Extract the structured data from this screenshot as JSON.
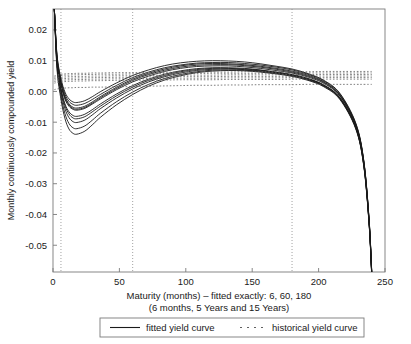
{
  "chart_data": {
    "type": "line",
    "title": "",
    "xlabel": "Maturity (months) – fitted exactly: 6, 60, 180",
    "xlabel_line2": "(6 months, 5 Years and 15 Years)",
    "ylabel": "Monthly continuously compounded yield",
    "xlim": [
      0,
      250
    ],
    "ylim": [
      -0.0587,
      0.0268
    ],
    "xticks": [
      0,
      50,
      100,
      150,
      200,
      250
    ],
    "xticklabels": [
      "0",
      "50",
      "100",
      "150",
      "200",
      "250"
    ],
    "yticks": [
      0.02,
      0.01,
      0.0,
      -0.01,
      -0.02,
      -0.03,
      -0.04,
      -0.05
    ],
    "yticklabels": [
      "0.02",
      "0.01",
      "0.00",
      "-0.01",
      "-0.02",
      "-0.03",
      "-0.04",
      "-0.05"
    ],
    "grid": false,
    "vertical_reference_lines": [
      6,
      60,
      180
    ],
    "vertical_reference_style": "dotted",
    "legend_position": "below-axes",
    "legend": [
      {
        "label": "fitted yield curve",
        "style": "solid",
        "color": "#1a1a1a"
      },
      {
        "label": "historical yield curve",
        "style": "dotted",
        "color": "#555555"
      }
    ],
    "x": [
      1,
      3,
      6,
      9,
      12,
      15,
      18,
      24,
      30,
      36,
      48,
      60,
      72,
      84,
      96,
      108,
      120,
      132,
      144,
      156,
      168,
      180,
      192,
      204,
      216,
      228,
      234,
      238,
      240
    ],
    "series": [
      {
        "name": "fitted yield curve 1",
        "style": "solid",
        "values": [
          0.0268,
          0.0105,
          0.0021,
          -0.0025,
          -0.0048,
          -0.0058,
          -0.0061,
          -0.0055,
          -0.004,
          -0.0024,
          0.0006,
          0.0031,
          0.005,
          0.0065,
          0.0075,
          0.0081,
          0.0083,
          0.0083,
          0.008,
          0.0075,
          0.0068,
          0.006,
          0.0047,
          0.0026,
          -0.0015,
          -0.011,
          -0.023,
          -0.042,
          -0.059
        ]
      },
      {
        "name": "fitted yield curve 2",
        "style": "solid",
        "values": [
          0.0268,
          0.0112,
          0.003,
          -0.0016,
          -0.004,
          -0.0051,
          -0.0054,
          -0.0048,
          -0.0033,
          -0.0016,
          0.0014,
          0.004,
          0.0059,
          0.0073,
          0.0083,
          0.0089,
          0.0091,
          0.009,
          0.0087,
          0.0082,
          0.0075,
          0.0066,
          0.0053,
          0.0031,
          -0.0011,
          -0.0108,
          -0.0228,
          -0.0418,
          -0.0588
        ]
      },
      {
        "name": "fitted yield curve 3",
        "style": "solid",
        "values": [
          0.0268,
          0.0098,
          0.001,
          -0.004,
          -0.0066,
          -0.0078,
          -0.0081,
          -0.0074,
          -0.0058,
          -0.004,
          -0.0008,
          0.0019,
          0.004,
          0.0056,
          0.0067,
          0.0074,
          0.0077,
          0.0077,
          0.0075,
          0.007,
          0.0063,
          0.0055,
          0.0042,
          0.0021,
          -0.002,
          -0.0115,
          -0.0235,
          -0.0424,
          -0.0592
        ]
      },
      {
        "name": "fitted yield curve 4",
        "style": "solid",
        "values": [
          0.0268,
          0.009,
          -0.0002,
          -0.0056,
          -0.0085,
          -0.0098,
          -0.0101,
          -0.0093,
          -0.0075,
          -0.0055,
          -0.0021,
          0.0008,
          0.0031,
          0.0048,
          0.006,
          0.0068,
          0.0072,
          0.0073,
          0.0071,
          0.0067,
          0.0061,
          0.0053,
          0.004,
          0.0019,
          -0.0022,
          -0.0118,
          -0.0238,
          -0.0426,
          -0.0594
        ]
      },
      {
        "name": "fitted yield curve 5",
        "style": "solid",
        "values": [
          0.0268,
          0.0082,
          -0.0014,
          -0.0072,
          -0.0104,
          -0.0118,
          -0.0121,
          -0.0112,
          -0.0092,
          -0.007,
          -0.0033,
          -0.0002,
          0.0023,
          0.0042,
          0.0055,
          0.0064,
          0.0069,
          0.007,
          0.0069,
          0.0065,
          0.0059,
          0.0051,
          0.0038,
          0.0017,
          -0.0024,
          -0.012,
          -0.024,
          -0.0428,
          -0.0596
        ]
      },
      {
        "name": "fitted yield curve 6",
        "style": "solid",
        "values": [
          0.0268,
          0.0074,
          -0.0026,
          -0.0088,
          -0.0122,
          -0.0136,
          -0.0139,
          -0.0129,
          -0.0107,
          -0.0083,
          -0.0043,
          -0.001,
          0.0017,
          0.0037,
          0.0051,
          0.0061,
          0.0066,
          0.0068,
          0.0067,
          0.0063,
          0.0057,
          0.0049,
          0.0036,
          0.0015,
          -0.0026,
          -0.0122,
          -0.0242,
          -0.043,
          -0.0598
        ]
      },
      {
        "name": "fitted yield curve 7",
        "style": "solid",
        "values": [
          0.0268,
          0.0116,
          0.0036,
          -0.0009,
          -0.0032,
          -0.0042,
          -0.0045,
          -0.0039,
          -0.0025,
          -0.0009,
          0.002,
          0.0045,
          0.0063,
          0.0077,
          0.0086,
          0.0092,
          0.0094,
          0.0094,
          0.0091,
          0.0086,
          0.0079,
          0.007,
          0.0056,
          0.0034,
          -0.0008,
          -0.0105,
          -0.0226,
          -0.0416,
          -0.0586
        ]
      },
      {
        "name": "fitted yield curve 8",
        "style": "solid",
        "values": [
          0.0268,
          0.012,
          0.0042,
          -0.0002,
          -0.0024,
          -0.0034,
          -0.0036,
          -0.003,
          -0.0016,
          0.0,
          0.0028,
          0.0052,
          0.007,
          0.0084,
          0.0093,
          0.0098,
          0.01,
          0.0099,
          0.0096,
          0.009,
          0.0082,
          0.0073,
          0.0058,
          0.0036,
          -0.0006,
          -0.0103,
          -0.0224,
          -0.0414,
          -0.0584
        ]
      },
      {
        "name": "fitted yield curve 9",
        "style": "solid",
        "values": [
          0.0268,
          0.0094,
          0.0005,
          -0.0046,
          -0.0073,
          -0.0086,
          -0.0089,
          -0.0082,
          -0.0065,
          -0.0047,
          -0.0014,
          0.0014,
          0.0036,
          0.0052,
          0.0064,
          0.0071,
          0.0075,
          0.0075,
          0.0073,
          0.0069,
          0.0062,
          0.0054,
          0.0041,
          0.002,
          -0.0021,
          -0.0117,
          -0.0237,
          -0.0425,
          -0.0593
        ]
      },
      {
        "name": "fitted yield curve 10",
        "style": "solid",
        "values": [
          0.0268,
          0.0108,
          0.0026,
          -0.002,
          -0.0044,
          -0.0055,
          -0.0058,
          -0.0052,
          -0.0037,
          -0.002,
          0.001,
          0.0036,
          0.0055,
          0.0069,
          0.0079,
          0.0085,
          0.0087,
          0.0087,
          0.0084,
          0.0079,
          0.0072,
          0.0063,
          0.005,
          0.0029,
          -0.0013,
          -0.0109,
          -0.0229,
          -0.0419,
          -0.0589
        ]
      },
      {
        "name": "historical yield curve 1",
        "style": "dotted",
        "values": [
          0.005,
          0.0053,
          0.0056,
          0.0057,
          0.0058,
          0.0058,
          0.0059,
          0.0059,
          0.006,
          0.006,
          0.0061,
          0.0061,
          0.0062,
          0.0062,
          0.0063,
          0.0063,
          0.0063,
          0.0063,
          0.0064,
          0.0064,
          0.0064,
          0.0064,
          0.0064,
          0.0065,
          0.0065,
          0.0065,
          0.0065,
          0.0065,
          0.0065
        ]
      },
      {
        "name": "historical yield curve 2",
        "style": "dotted",
        "values": [
          0.0046,
          0.0049,
          0.0052,
          0.0053,
          0.0053,
          0.0054,
          0.0054,
          0.0055,
          0.0055,
          0.0056,
          0.0056,
          0.0057,
          0.0057,
          0.0058,
          0.0058,
          0.0058,
          0.0059,
          0.0059,
          0.0059,
          0.0059,
          0.006,
          0.006,
          0.006,
          0.006,
          0.006,
          0.006,
          0.006,
          0.006,
          0.006
        ]
      },
      {
        "name": "historical yield curve 3",
        "style": "dotted",
        "values": [
          0.0042,
          0.0044,
          0.0046,
          0.0047,
          0.0048,
          0.0048,
          0.0049,
          0.0049,
          0.005,
          0.005,
          0.0051,
          0.0051,
          0.0052,
          0.0052,
          0.0053,
          0.0053,
          0.0053,
          0.0054,
          0.0054,
          0.0054,
          0.0054,
          0.0055,
          0.0055,
          0.0055,
          0.0055,
          0.0055,
          0.0055,
          0.0055,
          0.0055
        ]
      },
      {
        "name": "historical yield curve 4",
        "style": "dotted",
        "values": [
          0.0037,
          0.0039,
          0.0041,
          0.0042,
          0.0043,
          0.0043,
          0.0044,
          0.0044,
          0.0045,
          0.0045,
          0.0046,
          0.0046,
          0.0047,
          0.0047,
          0.0048,
          0.0048,
          0.0048,
          0.0049,
          0.0049,
          0.0049,
          0.0049,
          0.005,
          0.005,
          0.005,
          0.005,
          0.005,
          0.005,
          0.005,
          0.005
        ]
      },
      {
        "name": "historical yield curve 5",
        "style": "dotted",
        "values": [
          0.0032,
          0.0034,
          0.0036,
          0.0037,
          0.0038,
          0.0038,
          0.0039,
          0.0039,
          0.004,
          0.004,
          0.0041,
          0.0041,
          0.0042,
          0.0042,
          0.0043,
          0.0043,
          0.0043,
          0.0044,
          0.0044,
          0.0044,
          0.0044,
          0.0045,
          0.0045,
          0.0045,
          0.0045,
          0.0045,
          0.0045,
          0.0045,
          0.0045
        ]
      },
      {
        "name": "historical yield curve 6",
        "style": "dotted",
        "values": [
          0.0027,
          0.0029,
          0.0031,
          0.0032,
          0.0033,
          0.0033,
          0.0034,
          0.0034,
          0.0035,
          0.0035,
          0.0036,
          0.0036,
          0.0037,
          0.0037,
          0.0038,
          0.0038,
          0.0038,
          0.0039,
          0.0039,
          0.0039,
          0.0039,
          0.004,
          0.004,
          0.004,
          0.004,
          0.004,
          0.004,
          0.004,
          0.004
        ]
      },
      {
        "name": "historical yield curve 7",
        "style": "dotted",
        "values": [
          0.0006,
          0.0008,
          0.001,
          0.0011,
          0.0012,
          0.0012,
          0.0013,
          0.0013,
          0.0014,
          0.0014,
          0.0015,
          0.0016,
          0.0017,
          0.0018,
          0.0019,
          0.002,
          0.002,
          0.0021,
          0.0021,
          0.0022,
          0.0022,
          0.0022,
          0.0023,
          0.0023,
          0.0023,
          0.0023,
          0.0023,
          0.0023,
          0.0023
        ]
      }
    ]
  },
  "colors": {
    "fitted": "#1a1a1a",
    "historical": "#606060",
    "axis": "#7a7a7a",
    "reference_line": "#8a8a8a",
    "background": "#ffffff"
  }
}
